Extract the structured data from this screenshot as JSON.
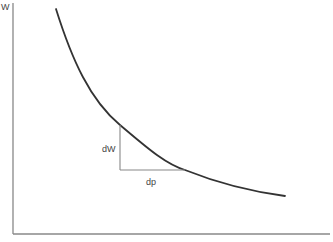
{
  "diagram": {
    "y_axis_label": "W",
    "x_axis_label": "",
    "triangle": {
      "vertical_label": "dW",
      "horizontal_label": "dp"
    },
    "colors": {
      "axis": "#888888",
      "curve": "#333333",
      "triangle": "#888888",
      "text": "#444444"
    }
  }
}
